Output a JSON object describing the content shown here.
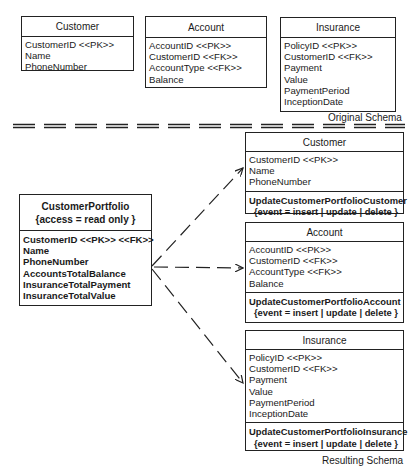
{
  "original_schema": {
    "label": "Original Schema",
    "tables": [
      {
        "name": "Customer",
        "attributes": [
          "CustomerID <<PK>>",
          "Name",
          "PhoneNumber"
        ]
      },
      {
        "name": "Account",
        "attributes": [
          "AccountID <<PK>>",
          "CustomerID <<FK>>",
          "AccountType <<FK>>",
          "Balance"
        ]
      },
      {
        "name": "Insurance",
        "attributes": [
          "PolicyID <<PK>>",
          "CustomerID <<FK>>",
          "Payment",
          "Value",
          "PaymentPeriod",
          "InceptionDate"
        ]
      }
    ]
  },
  "resulting_schema": {
    "label": "Resulting Schema",
    "view": {
      "name": "CustomerPortfolio",
      "constraint": "{access = read only }",
      "attributes": [
        "CustomerID <<PK>> <<FK>>",
        "Name",
        "PhoneNumber",
        "AccountsTotalBalance",
        "InsuranceTotalPayment",
        "InsuranceTotalValue"
      ]
    },
    "tables": [
      {
        "name": "Customer",
        "attributes": [
          "CustomerID <<PK>>",
          "Name",
          "PhoneNumber"
        ],
        "trigger": "UpdateCustomerPortfolioCustomer",
        "event": "{event = insert | update | delete }"
      },
      {
        "name": "Account",
        "attributes": [
          "AccountID <<PK>>",
          "CustomerID <<FK>>",
          "AccountType <<FK>>",
          "Balance"
        ],
        "trigger": "UpdateCustomerPortfolioAccount",
        "event": "{event = insert | update | delete }"
      },
      {
        "name": "Insurance",
        "attributes": [
          "PolicyID <<PK>>",
          "CustomerID <<FK>>",
          "Payment",
          "Value",
          "PaymentPeriod",
          "InceptionDate"
        ],
        "trigger": "UpdateCustomerPortfolioInsurance",
        "event": "{event = insert | update | delete }"
      }
    ]
  },
  "connectors": [
    {
      "from": "CustomerPortfolio",
      "to": "Customer",
      "style": "dashed-arrow"
    },
    {
      "from": "CustomerPortfolio",
      "to": "Account",
      "style": "dashed-arrow"
    },
    {
      "from": "CustomerPortfolio",
      "to": "Insurance",
      "style": "dashed-arrow"
    }
  ]
}
